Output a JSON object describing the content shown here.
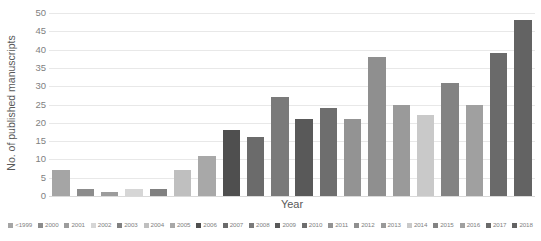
{
  "chart_data": {
    "type": "bar",
    "title": "",
    "xlabel": "Year",
    "ylabel": "No. of published manuscripts",
    "ylim": [
      0,
      50
    ],
    "ytick_step": 5,
    "yticks": [
      50,
      45,
      40,
      35,
      30,
      25,
      20,
      15,
      10,
      5,
      0
    ],
    "grid": true,
    "legend_position": "bottom",
    "categories": [
      "<1999",
      "2000",
      "2001",
      "2002",
      "2003",
      "2004",
      "2005",
      "2006",
      "2007",
      "2008",
      "2009",
      "2010",
      "2011",
      "2012",
      "2013",
      "2014",
      "2015",
      "2016",
      "2017",
      "2018"
    ],
    "values": [
      7,
      2,
      1,
      2,
      2,
      7,
      11,
      18,
      16,
      27,
      21,
      24,
      21,
      38,
      25,
      22,
      31,
      25,
      39,
      48
    ],
    "colors": [
      "#a5a5a5",
      "#8c8c8c",
      "#9c9c9c",
      "#d6d6d6",
      "#808080",
      "#bfbfbf",
      "#a8a8a8",
      "#4f4f4f",
      "#6b6b6b",
      "#7a7a7a",
      "#595959",
      "#6e6e6e",
      "#939393",
      "#8f8f8f",
      "#9a9a9a",
      "#c9c9c9",
      "#838383",
      "#a0a0a0",
      "#6a6a6a",
      "#636363"
    ]
  },
  "axis": {
    "y_title": "No. of published manuscripts",
    "x_title": "Year"
  }
}
